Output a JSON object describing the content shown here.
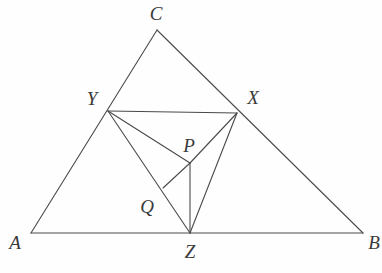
{
  "figure": {
    "kind": "geometry-diagram",
    "width": 382,
    "height": 273,
    "background_color": "#fefefe",
    "stroke_color": "#4a4a4a",
    "stroke_width": 1.1,
    "label_color": "#3a3a3a"
  },
  "points": {
    "A": {
      "label": "A",
      "x": 31,
      "y": 233,
      "label_x": 15,
      "label_y": 242
    },
    "B": {
      "label": "B",
      "x": 363,
      "y": 233,
      "label_x": 374,
      "label_y": 242
    },
    "C": {
      "label": "C",
      "x": 157,
      "y": 30,
      "label_x": 156,
      "label_y": 13
    },
    "X": {
      "label": "X",
      "x": 237,
      "y": 113,
      "label_x": 253,
      "label_y": 97
    },
    "Y": {
      "label": "Y",
      "x": 108,
      "y": 111,
      "label_x": 92,
      "label_y": 98
    },
    "Z": {
      "label": "Z",
      "x": 190,
      "y": 233,
      "label_x": 190,
      "label_y": 251
    },
    "P": {
      "label": "P",
      "x": 190,
      "y": 163,
      "label_x": 189,
      "label_y": 145
    },
    "Q": {
      "label": "Q",
      "x": 163,
      "y": 188,
      "label_x": 147,
      "label_y": 206
    }
  },
  "segments": [
    {
      "name": "segment-AB",
      "from": "A",
      "to": "B"
    },
    {
      "name": "segment-AC",
      "from": "A",
      "to": "C"
    },
    {
      "name": "segment-CB",
      "from": "C",
      "to": "B"
    },
    {
      "name": "segment-YX",
      "from": "Y",
      "to": "X"
    },
    {
      "name": "segment-YZ",
      "from": "Y",
      "to": "Z"
    },
    {
      "name": "segment-XZ",
      "from": "X",
      "to": "Z"
    },
    {
      "name": "segment-YP",
      "from": "Y",
      "to": "P"
    },
    {
      "name": "segment-XP",
      "from": "X",
      "to": "P"
    },
    {
      "name": "segment-PZ",
      "from": "P",
      "to": "Z"
    },
    {
      "name": "segment-PQ",
      "from": "P",
      "to": "Q"
    }
  ],
  "labels_order": [
    "C",
    "Y",
    "X",
    "P",
    "Q",
    "A",
    "Z",
    "B"
  ]
}
